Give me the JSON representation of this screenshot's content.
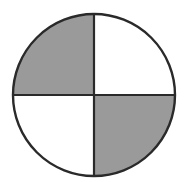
{
  "diagram": {
    "type": "fraction-circle",
    "total_parts": 4,
    "shaded_parts": 2,
    "shaded_quadrants": [
      "top-left",
      "bottom-right"
    ],
    "unshaded_quadrants": [
      "top-right",
      "bottom-left"
    ],
    "colors": {
      "background": "#ffffff",
      "shade": "#9a9a9a",
      "stroke": "#2a2a2a",
      "unshaded": "#ffffff"
    }
  }
}
